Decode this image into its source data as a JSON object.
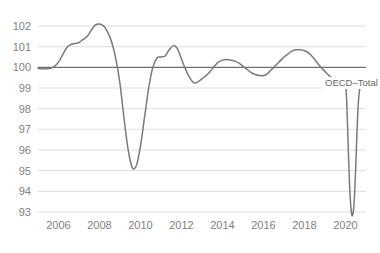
{
  "chart_data": {
    "type": "line",
    "title": "",
    "subtitle": "",
    "xlabel": "",
    "ylabel": "",
    "xlim": [
      2005.0,
      2021.0
    ],
    "ylim": [
      93,
      102
    ],
    "grid": true,
    "legend_position": "inline-annotation",
    "baseline_value": 100,
    "y_ticks": [
      102,
      101,
      100,
      99,
      98,
      97,
      96,
      95,
      94,
      93
    ],
    "y_tick_labels": [
      "102",
      "101",
      "100",
      "99",
      "98",
      "97",
      "96",
      "95",
      "94",
      "93"
    ],
    "x_ticks": [
      2006,
      2008,
      2010,
      2012,
      2014,
      2016,
      2018,
      2020
    ],
    "x_tick_labels": [
      "2006",
      "2008",
      "2010",
      "2012",
      "2014",
      "2016",
      "2018",
      "2020"
    ],
    "series": [
      {
        "name": "OECD–Total",
        "color": "#7a7a7a",
        "annotation": "OECD–Total",
        "annotation_x": 2019.0,
        "annotation_y": 99.1,
        "x": [
          2005.0,
          2005.2,
          2005.4,
          2005.6,
          2005.8,
          2006.0,
          2006.2,
          2006.4,
          2006.6,
          2006.8,
          2007.0,
          2007.2,
          2007.4,
          2007.6,
          2007.8,
          2008.0,
          2008.2,
          2008.4,
          2008.6,
          2008.8,
          2009.0,
          2009.2,
          2009.4,
          2009.6,
          2009.8,
          2010.0,
          2010.2,
          2010.4,
          2010.6,
          2010.8,
          2011.0,
          2011.2,
          2011.4,
          2011.6,
          2011.8,
          2012.0,
          2012.2,
          2012.4,
          2012.6,
          2012.8,
          2013.0,
          2013.2,
          2013.4,
          2013.6,
          2013.8,
          2014.0,
          2014.2,
          2014.4,
          2014.6,
          2014.8,
          2015.0,
          2015.2,
          2015.4,
          2015.6,
          2015.8,
          2016.0,
          2016.2,
          2016.4,
          2016.6,
          2016.8,
          2017.0,
          2017.2,
          2017.4,
          2017.6,
          2017.8,
          2018.0,
          2018.2,
          2018.4,
          2018.6,
          2018.8,
          2019.0,
          2019.2,
          2019.4,
          2019.6,
          2019.8,
          2020.0,
          2020.05,
          2020.1,
          2020.15,
          2020.2,
          2020.25,
          2020.3,
          2020.35,
          2020.4,
          2020.45,
          2020.5,
          2020.55,
          2020.6,
          2020.65,
          2020.7,
          2020.75,
          2020.8
        ],
        "y": [
          99.95,
          99.92,
          99.93,
          99.95,
          100.05,
          100.25,
          100.6,
          100.95,
          101.1,
          101.15,
          101.2,
          101.35,
          101.5,
          101.8,
          102.05,
          102.1,
          102.0,
          101.7,
          101.2,
          100.4,
          99.2,
          97.5,
          96.0,
          95.15,
          95.25,
          96.2,
          97.6,
          99.0,
          100.0,
          100.45,
          100.5,
          100.55,
          100.85,
          101.05,
          100.9,
          100.4,
          99.9,
          99.5,
          99.25,
          99.3,
          99.45,
          99.6,
          99.8,
          100.05,
          100.25,
          100.35,
          100.38,
          100.35,
          100.3,
          100.2,
          100.05,
          99.9,
          99.75,
          99.65,
          99.6,
          99.6,
          99.7,
          99.9,
          100.1,
          100.3,
          100.5,
          100.65,
          100.8,
          100.85,
          100.85,
          100.8,
          100.7,
          100.5,
          100.25,
          100.0,
          99.8,
          99.6,
          99.45,
          99.35,
          99.3,
          99.2,
          98.5,
          97.2,
          95.6,
          94.3,
          93.4,
          92.9,
          92.85,
          93.2,
          94.0,
          95.2,
          96.6,
          97.8,
          98.6,
          99.0,
          99.2,
          99.3
        ]
      }
    ]
  }
}
